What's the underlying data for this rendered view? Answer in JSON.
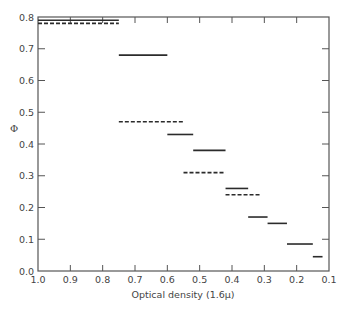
{
  "chart_data": {
    "type": "line",
    "subtype": "step-segments",
    "title": "",
    "xlabel": "Optical density (1.6μ)",
    "ylabel": "Φ",
    "xlim": [
      1.0,
      0.1
    ],
    "ylim": [
      0.0,
      0.8
    ],
    "x_reversed": true,
    "grid": false,
    "legend": null,
    "x_ticks": [
      1.0,
      0.9,
      0.8,
      0.7,
      0.6,
      0.5,
      0.4,
      0.3,
      0.2,
      0.1
    ],
    "x_tick_labels": [
      "1.0",
      "0.9",
      "0.8",
      "0.7",
      "0.6",
      "0.5",
      "0.4",
      "0.3",
      "0.2",
      "0.1"
    ],
    "y_ticks": [
      0.0,
      0.1,
      0.2,
      0.3,
      0.4,
      0.5,
      0.6,
      0.7,
      0.8
    ],
    "y_tick_labels": [
      "0.0",
      "0.1",
      "0.2",
      "0.3",
      "0.4",
      "0.5",
      "0.6",
      "0.7",
      "0.8"
    ],
    "series": [
      {
        "name": "solid",
        "style": "solid",
        "segments": [
          {
            "x_start": 1.0,
            "x_end": 0.75,
            "y": 0.79
          },
          {
            "x_start": 0.75,
            "x_end": 0.6,
            "y": 0.68
          },
          {
            "x_start": 0.6,
            "x_end": 0.52,
            "y": 0.43
          },
          {
            "x_start": 0.52,
            "x_end": 0.42,
            "y": 0.38
          },
          {
            "x_start": 0.42,
            "x_end": 0.35,
            "y": 0.26
          },
          {
            "x_start": 0.35,
            "x_end": 0.29,
            "y": 0.17
          },
          {
            "x_start": 0.29,
            "x_end": 0.23,
            "y": 0.15
          },
          {
            "x_start": 0.23,
            "x_end": 0.15,
            "y": 0.085
          },
          {
            "x_start": 0.15,
            "x_end": 0.12,
            "y": 0.045
          }
        ]
      },
      {
        "name": "dashed",
        "style": "dashed",
        "segments": [
          {
            "x_start": 1.0,
            "x_end": 0.75,
            "y": 0.78
          },
          {
            "x_start": 0.75,
            "x_end": 0.55,
            "y": 0.47
          },
          {
            "x_start": 0.55,
            "x_end": 0.42,
            "y": 0.31
          },
          {
            "x_start": 0.42,
            "x_end": 0.31,
            "y": 0.24
          }
        ]
      }
    ],
    "colors": {
      "axis": "#555555",
      "line": "#2b2b2b",
      "background": "#ffffff"
    }
  }
}
